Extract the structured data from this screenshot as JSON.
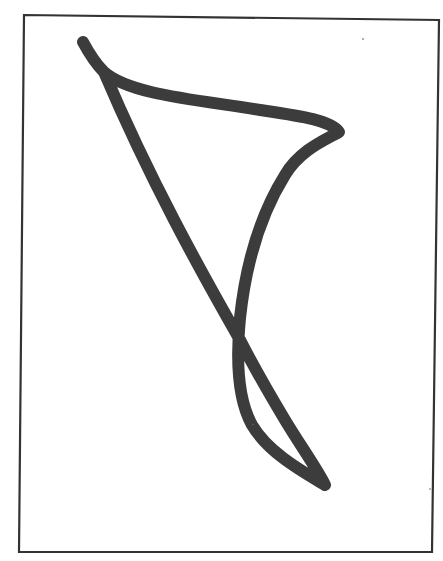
{
  "figure": {
    "description": "Single continuous freehand stroke forming a triangle-like shape with a crossing and a small lower loop, enclosed in a rectangular frame",
    "colors": {
      "background": "#ffffff",
      "stroke": "#3c3c3c",
      "frame": "#333333"
    },
    "frame": {
      "points": "24,15 439,20 432,552 19,552",
      "stroke_width": 2.2
    },
    "stroke": {
      "width": 12,
      "path": "M 83 42 C 90 55, 97 65, 104 72 C 130 95, 200 100, 260 110 C 300 116, 330 120, 339 132 C 325 140, 300 150, 285 175 C 262 212, 246 262, 240 318 C 236 360, 238 400, 252 425 C 268 452, 300 470, 325 485 C 318 470, 300 445, 285 420 C 270 395, 258 375, 240 340 C 200 270, 150 180, 104 72"
    },
    "specks": [
      {
        "cx": 363,
        "cy": 39,
        "r": 1.1
      },
      {
        "cx": 430,
        "cy": 489,
        "r": 0.9
      }
    ]
  }
}
